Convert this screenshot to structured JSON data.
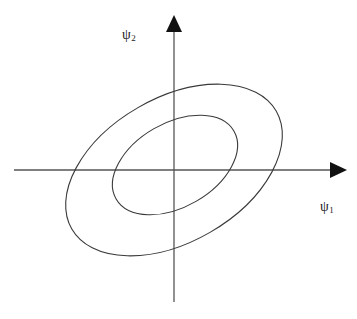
{
  "figure": {
    "name": "phase-space-contour-plot",
    "background_color": "#ffffff",
    "stroke_color": "#3a3a3a",
    "axis_color": "#555555",
    "label_color": "#222222"
  },
  "axes": {
    "origin": {
      "x": 174,
      "y": 170
    },
    "horizontal": {
      "name": "psi1-axis",
      "x_start": 14,
      "x_end": 345,
      "y": 170,
      "arrow": "right",
      "label_symbol": "ψ",
      "label_subscript": "1",
      "label_text": "ψ1",
      "label_x": 320,
      "label_y": 200
    },
    "vertical": {
      "name": "psi2-axis",
      "y_start": 18,
      "y_end": 302,
      "x": 174,
      "arrow": "up",
      "label_symbol": "ψ",
      "label_subscript": "2",
      "label_text": "ψ2",
      "label_x": 122,
      "label_y": 28
    }
  },
  "chart_data": {
    "type": "line",
    "title": "",
    "xlabel": "ψ1",
    "ylabel": "ψ2",
    "grid": false,
    "legend": null,
    "series": [
      {
        "name": "outer-contour-ellipse",
        "shape": "ellipse",
        "center_x": 174,
        "center_y": 170,
        "semi_axis_major": 118,
        "semi_axis_minor": 72,
        "rotation_deg": -30,
        "stroke": "#3a3a3a",
        "stroke_width": 1.1,
        "fill": "none"
      },
      {
        "name": "inner-contour-ellipse",
        "shape": "ellipse",
        "center_x": 175,
        "center_y": 165,
        "semi_axis_major": 68,
        "semi_axis_minor": 42,
        "rotation_deg": -30,
        "stroke": "#3a3a3a",
        "stroke_width": 1.1,
        "fill": "none"
      }
    ],
    "xlim": [
      14,
      345
    ],
    "ylim": [
      18,
      302
    ]
  }
}
